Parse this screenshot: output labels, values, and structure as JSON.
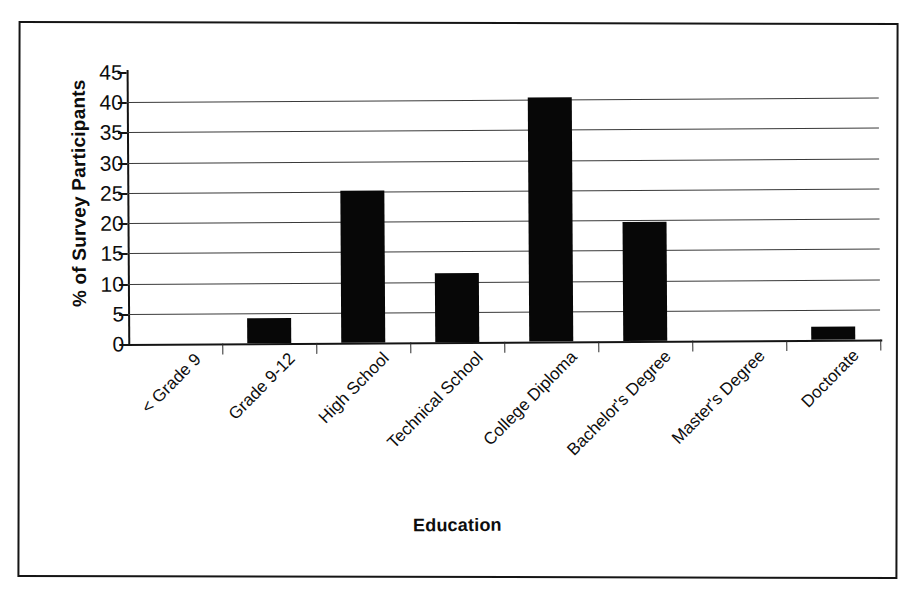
{
  "chart_data": {
    "type": "bar",
    "title": "",
    "xlabel": "Education",
    "ylabel": "% of Survey Participants",
    "categories": [
      "< Grade 9",
      "Grade 9-12",
      "High School",
      "Technical School",
      "College Diploma",
      "Bachelor's Degree",
      "Master's Degree",
      "Doctorate"
    ],
    "values": [
      0,
      4.2,
      25.2,
      11.5,
      40.3,
      19.7,
      0,
      2.2
    ],
    "ylim": [
      0,
      45
    ],
    "ytick_labels": [
      "0",
      "5",
      "10",
      "15",
      "20",
      "25",
      "30",
      "35",
      "40",
      "45"
    ],
    "ytick_values": [
      0,
      5,
      10,
      15,
      20,
      25,
      30,
      35,
      40,
      45
    ],
    "grid": "horizontal",
    "legend": "none",
    "bar_color": "#070707",
    "axis_color": "#141414",
    "grid_color": "#3a3a3a",
    "background_color": "#ffffff"
  }
}
